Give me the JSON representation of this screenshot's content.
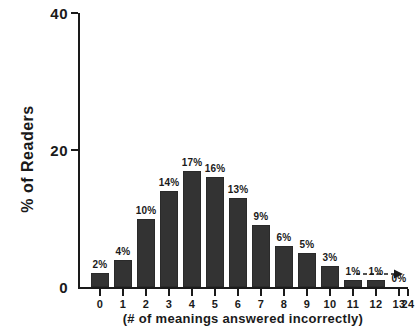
{
  "chart_data": {
    "type": "bar",
    "title": "",
    "subtitle": "",
    "xlabel": "(# of meanings answered incorrectly)",
    "ylabel": "% of Readers",
    "categories": [
      "0",
      "1",
      "2",
      "3",
      "4",
      "5",
      "6",
      "7",
      "8",
      "9",
      "10",
      "11",
      "12",
      "13",
      "24"
    ],
    "values": [
      2,
      4,
      10,
      14,
      17,
      16,
      13,
      9,
      6,
      5,
      3,
      1,
      1,
      0,
      0
    ],
    "data_labels": [
      "2%",
      "4%",
      "10%",
      "14%",
      "17%",
      "16%",
      "13%",
      "9%",
      "6%",
      "5%",
      "3%",
      "1%",
      "1%",
      "0%",
      ""
    ],
    "ylim": [
      0,
      40
    ],
    "xlim_labels": [
      "0",
      "24"
    ],
    "y_ticks": [
      0,
      20,
      40
    ],
    "y_tick_labels": [
      "0",
      "20",
      "40"
    ],
    "grid": false,
    "legend": null,
    "legend_position": "none",
    "annotations": [
      {
        "name": "zero-tail-arrow",
        "text": "0%",
        "description": "dashed arrow extending right from the 0% label toward category 24"
      }
    ],
    "bar_color": "#333333",
    "axis_color": "#1a1a1a",
    "background_color": "#ffffff"
  }
}
